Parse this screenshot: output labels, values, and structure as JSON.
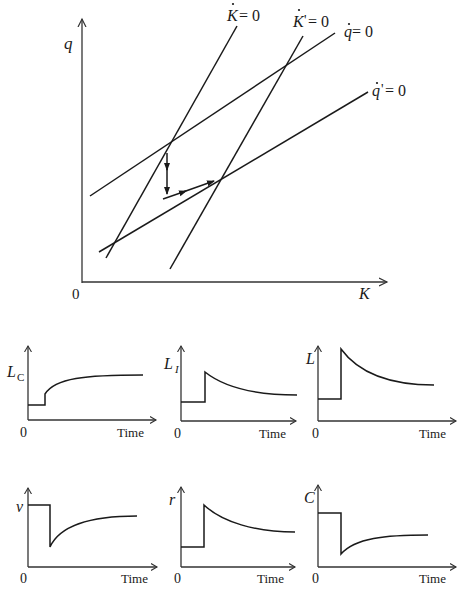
{
  "main_diagram": {
    "y_axis_label": "q",
    "x_axis_label": "K",
    "origin_label": "0",
    "curves": [
      {
        "name": "K-dot = 0",
        "label_var": "K",
        "label_prime": "",
        "label_rest": " = 0",
        "from": [
          237,
          26
        ],
        "to": [
          106,
          258
        ]
      },
      {
        "name": "K'-dot = 0",
        "label_var": "K",
        "label_prime": "'",
        "label_rest": " = 0",
        "from": [
          303,
          36
        ],
        "to": [
          170,
          269
        ]
      },
      {
        "name": "q-dot = 0",
        "label_var": "q",
        "label_prime": "",
        "label_rest": " = 0",
        "from": [
          335,
          33
        ],
        "to": [
          90,
          196
        ]
      },
      {
        "name": "q'-dot = 0",
        "label_var": "q",
        "label_prime": "'",
        "label_rest": " = 0",
        "from": [
          368,
          92
        ],
        "to": [
          99,
          252
        ]
      }
    ],
    "initial_equilibrium": [
      170,
      142
    ],
    "new_equilibrium": [
      219,
      179
    ],
    "adjustment_path": "jump down in q, then move along saddle path to new equilibrium"
  },
  "panels": [
    {
      "id": "LC",
      "y_label_main": "L",
      "y_label_sub": "C",
      "x_label": "Time",
      "origin": "0",
      "shape": "step up then gradual rise"
    },
    {
      "id": "LI",
      "y_label_main": "L",
      "y_label_sub": "I",
      "x_label": "Time",
      "origin": "0",
      "shape": "jump up then decay"
    },
    {
      "id": "L",
      "y_label_main": "L",
      "y_label_sub": "",
      "x_label": "Time",
      "origin": "0",
      "shape": "jump up then decay"
    },
    {
      "id": "v",
      "y_label_main": "v",
      "y_label_sub": "",
      "x_label": "Time",
      "origin": "0",
      "shape": "drop then partial recovery"
    },
    {
      "id": "r",
      "y_label_main": "r",
      "y_label_sub": "",
      "x_label": "Time",
      "origin": "0",
      "shape": "jump up then decay"
    },
    {
      "id": "C",
      "y_label_main": "C",
      "y_label_sub": "",
      "x_label": "Time",
      "origin": "0",
      "shape": "drop then partial recovery"
    }
  ]
}
